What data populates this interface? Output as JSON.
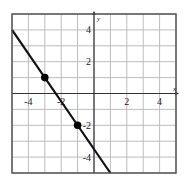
{
  "chart_data": {
    "type": "line",
    "title": "",
    "xlabel": "x",
    "ylabel": "y",
    "xlim": [
      -5,
      5
    ],
    "ylim": [
      -5,
      5
    ],
    "grid": true,
    "grid_step": 1,
    "x_tick_labels": [
      {
        "value": -4,
        "label": "-4"
      },
      {
        "value": -2,
        "label": "-2"
      },
      {
        "value": 2,
        "label": "2"
      },
      {
        "value": 4,
        "label": "4"
      }
    ],
    "y_tick_labels": [
      {
        "value": 4,
        "label": "4"
      },
      {
        "value": 2,
        "label": "2"
      },
      {
        "value": -2,
        "label": "-2"
      },
      {
        "value": -4,
        "label": "-4"
      }
    ],
    "series": [
      {
        "name": "line",
        "equation": "y = -1.5x - 3.5",
        "slope": -1.5,
        "intercept": -3.5,
        "x": [
          -5,
          1
        ],
        "y": [
          4,
          -5
        ]
      }
    ],
    "points": [
      {
        "x": -3,
        "y": 1
      },
      {
        "x": -1,
        "y": -2
      }
    ]
  },
  "colors": {
    "grid": "#bdbdbd",
    "frame": "#555555",
    "axis": "#333333",
    "line": "#111111",
    "point": "#000000"
  }
}
